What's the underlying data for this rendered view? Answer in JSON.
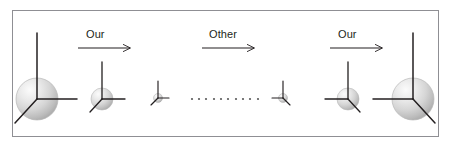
{
  "figure": {
    "width": 451,
    "height": 151,
    "background_color": "#ffffff",
    "frame": {
      "name": "figure-border",
      "x": 12,
      "y": 10,
      "width": 427,
      "height": 127,
      "border_color": "#8f8f94",
      "border_width": 1
    },
    "colors": {
      "axis_stroke": "#231f20",
      "arrow_stroke": "#231f20",
      "label_text": "#231f20",
      "sphere_highlight": "#f4f4f4",
      "sphere_mid": "#d8d8d8",
      "sphere_shadow": "#a8a8a8",
      "sphere_outline": "#b5b5b5",
      "dot_color": "#5a5a5a"
    },
    "caption": ""
  },
  "arrows": [
    {
      "id": "arrow-our-1",
      "label": "Our",
      "x1": 78,
      "y1": 48,
      "x2": 132,
      "y2": 48,
      "label_x": 86,
      "label_y": 28,
      "direction": "right"
    },
    {
      "id": "arrow-other",
      "label": "Other",
      "x1": 202,
      "y1": 48,
      "x2": 256,
      "y2": 48,
      "label_x": 209,
      "label_y": 28,
      "direction": "right"
    },
    {
      "id": "arrow-our-2",
      "label": "Our",
      "x1": 330,
      "y1": 48,
      "x2": 384,
      "y2": 48,
      "label_x": 338,
      "label_y": 28,
      "direction": "right"
    }
  ],
  "frames": [
    {
      "id": "frame-1",
      "order": 1,
      "cx": 37,
      "cy": 99,
      "sphere_r": 21,
      "axis_up_len": 66,
      "axis_side_len": 40,
      "axis_diag_len": 33,
      "mirrored": false,
      "scale_label": "largest"
    },
    {
      "id": "frame-2",
      "order": 2,
      "cx": 102,
      "cy": 99,
      "sphere_r": 11,
      "axis_up_len": 37,
      "axis_side_len": 23,
      "axis_diag_len": 18,
      "mirrored": false,
      "scale_label": "medium"
    },
    {
      "id": "frame-3",
      "order": 3,
      "cx": 158,
      "cy": 98,
      "sphere_r": 4.5,
      "axis_up_len": 17,
      "axis_side_len": 11,
      "axis_diag_len": 8,
      "mirrored": false,
      "scale_label": "smallest"
    },
    {
      "id": "frame-4",
      "order": 4,
      "cx": 283,
      "cy": 98,
      "sphere_r": 4.5,
      "axis_up_len": 17,
      "axis_side_len": 11,
      "axis_diag_len": 8,
      "mirrored": true,
      "scale_label": "smallest"
    },
    {
      "id": "frame-5",
      "order": 5,
      "cx": 348,
      "cy": 99,
      "sphere_r": 11,
      "axis_up_len": 37,
      "axis_side_len": 23,
      "axis_diag_len": 18,
      "mirrored": true,
      "scale_label": "medium"
    },
    {
      "id": "frame-6",
      "order": 6,
      "cx": 413,
      "cy": 99,
      "sphere_r": 21,
      "axis_up_len": 66,
      "axis_side_len": 40,
      "axis_diag_len": 33,
      "mirrored": true,
      "scale_label": "largest"
    }
  ],
  "ellipsis": {
    "id": "ellipsis-dots",
    "count": 10,
    "x_start": 192,
    "x_end": 258,
    "y": 99,
    "dot_radius": 1.1,
    "color": "#5a5a5a"
  }
}
